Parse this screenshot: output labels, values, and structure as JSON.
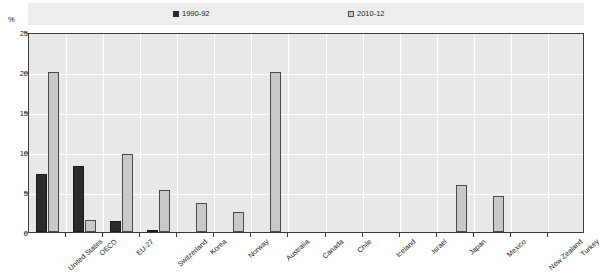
{
  "axis": {
    "unit_label": "%",
    "y_ticks": [
      0,
      5,
      10,
      15,
      20,
      25
    ]
  },
  "legend": {
    "items": [
      {
        "label": "1990-92",
        "swatch": "dark-square-icon",
        "color": "#2b2b2b"
      },
      {
        "label": "2010-12",
        "swatch": "light-square-icon",
        "color": "#c9c9c9"
      }
    ]
  },
  "chart_data": {
    "type": "bar",
    "title": "",
    "subtitle": "",
    "xlabel": "",
    "ylabel": "%",
    "ylim": [
      0,
      25
    ],
    "ytick_step": 5,
    "grid": true,
    "legend_position": "top",
    "categories": [
      "United States",
      "OECD",
      "EU-27",
      "Switzerland",
      "Korea",
      "Norway",
      "Australia",
      "Canada",
      "Chile",
      "Iceland",
      "Israel",
      "Japan",
      "Mexico",
      "New Zealand",
      "Turkey"
    ],
    "series": [
      {
        "name": "1990-92",
        "color": "#2b2b2b",
        "values": [
          7.3,
          8.2,
          1.4,
          0.3,
          0.0,
          0.0,
          0.0,
          0.0,
          0.0,
          0.0,
          0.0,
          0.0,
          0.0,
          0.0,
          0.0
        ]
      },
      {
        "name": "2010-12",
        "color": "#c9c9c9",
        "values": [
          20.0,
          1.5,
          9.7,
          5.2,
          3.6,
          2.5,
          20.0,
          0.0,
          0.0,
          0.0,
          0.0,
          5.9,
          4.5,
          0.0,
          0.0
        ]
      }
    ]
  }
}
